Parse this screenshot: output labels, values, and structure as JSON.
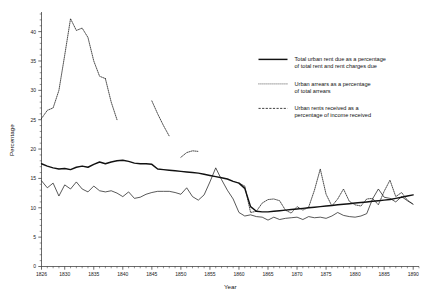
{
  "chart_data": {
    "type": "line",
    "title": "",
    "xlabel": "Year",
    "ylabel": "Percentage",
    "xlim": [
      1826,
      1891
    ],
    "ylim": [
      0,
      43
    ],
    "grid": false,
    "legend_position": "upper-right-inside",
    "x_ticks": [
      1826,
      1830,
      1835,
      1840,
      1845,
      1850,
      1855,
      1860,
      1865,
      1870,
      1875,
      1880,
      1885,
      1890
    ],
    "x_tick_labels": [
      "1826",
      "1830",
      "1835",
      "1840",
      "1845",
      "1850",
      "1855",
      "1860",
      "1865",
      "1870",
      "1875",
      "1880",
      "1885",
      "1890"
    ],
    "x_minor_step": 1,
    "y_ticks": [
      0,
      5,
      10,
      15,
      20,
      25,
      30,
      35,
      40
    ],
    "y_tick_labels": [
      "0",
      "5",
      "10",
      "15",
      "20",
      "25",
      "30",
      "35",
      "40"
    ],
    "y_minor_step": 1,
    "series": [
      {
        "name": "Total urban rent due as a percentage of total rent and rent charges due",
        "style": "solid",
        "x": [
          1826,
          1827,
          1828,
          1829,
          1830,
          1831,
          1832,
          1833,
          1834,
          1835,
          1836,
          1837,
          1838,
          1839,
          1840,
          1841,
          1842,
          1843,
          1844,
          1845,
          1846,
          1847,
          1848,
          1849,
          1850,
          1851,
          1852,
          1853,
          1854,
          1855,
          1856,
          1857,
          1858,
          1859,
          1860,
          1861,
          1862,
          1863,
          1864,
          1865,
          1866,
          1867,
          1868,
          1869,
          1870,
          1871,
          1872,
          1873,
          1874,
          1875,
          1876,
          1877,
          1878,
          1879,
          1880,
          1881,
          1882,
          1883,
          1884,
          1885,
          1886,
          1887,
          1888,
          1889,
          1890
        ],
        "y": [
          17.5,
          17.1,
          16.8,
          16.6,
          16.7,
          16.5,
          16.9,
          17.1,
          16.9,
          17.4,
          17.8,
          17.5,
          17.8,
          18.0,
          18.1,
          17.9,
          17.6,
          17.5,
          17.5,
          17.4,
          16.6,
          16.5,
          16.4,
          16.3,
          16.2,
          16.1,
          16.0,
          15.9,
          15.7,
          15.5,
          15.3,
          15.1,
          14.9,
          14.5,
          14.2,
          13.3,
          10.2,
          9.4,
          9.3,
          9.3,
          9.4,
          9.5,
          9.6,
          9.7,
          9.8,
          9.9,
          10.0,
          10.1,
          10.2,
          10.3,
          10.4,
          10.5,
          10.6,
          10.7,
          10.8,
          10.9,
          11.0,
          11.1,
          11.2,
          11.3,
          11.4,
          11.6,
          11.8,
          12.0,
          12.2
        ]
      },
      {
        "name": "Urban arrears as a percentage of total arrears",
        "style": "dotted",
        "segments": [
          {
            "x": [
              1826,
              1827,
              1828,
              1829,
              1830,
              1831,
              1832,
              1833,
              1834,
              1835,
              1836,
              1837
            ],
            "y": [
              25.2,
              26.6,
              27.0,
              30.0,
              36.0,
              42.2,
              40.2,
              40.6,
              39.0,
              35.0,
              32.4,
              32.0
            ]
          },
          {
            "x": [
              1837,
              1838,
              1839
            ],
            "y": [
              32.0,
              28.0,
              25.0
            ]
          },
          {
            "x": [
              1845,
              1846,
              1847,
              1848
            ],
            "y": [
              28.2,
              26.0,
              24.0,
              22.2
            ]
          },
          {
            "x": [
              1850,
              1851,
              1852,
              1853
            ],
            "y": [
              18.6,
              19.4,
              19.7,
              19.6
            ]
          },
          {
            "x": [
              1860,
              1861,
              1862,
              1863,
              1864,
              1865,
              1866,
              1867,
              1868,
              1869,
              1870,
              1871,
              1872,
              1873,
              1874,
              1875,
              1876,
              1877,
              1878,
              1879,
              1880,
              1881,
              1882,
              1883,
              1884,
              1885,
              1886,
              1887,
              1888,
              1889,
              1890
            ],
            "y": [
              14.2,
              13.7,
              9.2,
              9.4,
              10.8,
              11.4,
              11.5,
              11.2,
              9.6,
              9.1,
              10.2,
              9.6,
              10.1,
              13.0,
              16.6,
              12.3,
              10.3,
              11.5,
              13.2,
              11.1,
              10.5,
              10.3,
              11.5,
              11.6,
              10.5,
              12.8,
              14.7,
              11.9,
              12.6,
              11.3,
              10.6
            ]
          }
        ]
      },
      {
        "name": "Urban rents received as a percentage of income received",
        "style": "dashed",
        "x": [
          1826,
          1827,
          1828,
          1829,
          1830,
          1831,
          1832,
          1833,
          1834,
          1835,
          1836,
          1837,
          1838,
          1839,
          1840,
          1841,
          1842,
          1843,
          1844,
          1845,
          1846,
          1847,
          1848,
          1849,
          1850,
          1851,
          1852,
          1853,
          1854,
          1855,
          1856,
          1857,
          1858,
          1859,
          1860,
          1861,
          1862,
          1863,
          1864,
          1865,
          1866,
          1867,
          1868,
          1869,
          1870,
          1871,
          1872,
          1873,
          1874,
          1875,
          1876,
          1877,
          1878,
          1879,
          1880,
          1881,
          1882,
          1883,
          1884,
          1885,
          1886,
          1887,
          1888,
          1889,
          1890
        ],
        "y": [
          14.6,
          13.4,
          14.2,
          12.0,
          13.9,
          13.2,
          14.4,
          13.2,
          12.7,
          13.7,
          12.9,
          12.7,
          12.9,
          12.5,
          11.9,
          12.7,
          11.6,
          11.8,
          12.3,
          12.6,
          12.8,
          12.8,
          12.8,
          12.6,
          12.3,
          13.4,
          11.9,
          11.3,
          12.2,
          14.4,
          16.8,
          14.8,
          13.0,
          11.5,
          9.2,
          8.6,
          8.8,
          8.5,
          8.4,
          7.9,
          8.4,
          8.0,
          8.2,
          8.3,
          8.4,
          8.0,
          8.5,
          8.3,
          8.4,
          8.2,
          8.6,
          9.2,
          8.7,
          8.5,
          8.4,
          8.6,
          9.0,
          11.5,
          13.2,
          11.8,
          11.6,
          11.0,
          11.9,
          11.2,
          10.6
        ]
      }
    ],
    "legend": [
      {
        "style": "solid",
        "line1": "Total urban rent due as a percentage",
        "line2": "of total rent and rent charges due"
      },
      {
        "style": "dotted",
        "line1": "Urban arrears as a percentage",
        "line2": "of total arrears"
      },
      {
        "style": "dashed",
        "line1": "Urban rents received as a",
        "line2": "percentage of income received"
      }
    ]
  }
}
